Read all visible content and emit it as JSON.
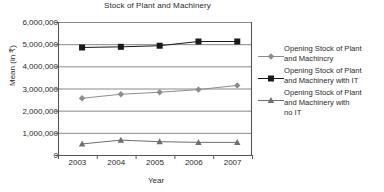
{
  "chart_data": {
    "type": "line",
    "title": "Stock of Plant and Machinery",
    "xlabel": "Year",
    "ylabel": "Mean (in ₹)",
    "categories": [
      "2003",
      "2004",
      "2005",
      "2006",
      "2007"
    ],
    "x": [
      2003,
      2004,
      2005,
      2006,
      2007
    ],
    "ylim": [
      0,
      6000000
    ],
    "ytick_labels": [
      "0",
      "1,000,000",
      "2,000,000",
      "3,000,000",
      "4,000,000",
      "5,000,000",
      "6,000,000"
    ],
    "ytick_values": [
      0,
      1000000,
      2000000,
      3000000,
      4000000,
      5000000,
      6000000
    ],
    "grid": true,
    "legend_position": "right",
    "series": [
      {
        "name": "Opening Stock of Plant and Machincry",
        "name_lines": [
          "Opening Stock of Plant",
          "and Machincry"
        ],
        "marker": "diamond",
        "color": "#8c8c8c",
        "values": [
          2560000,
          2740000,
          2830000,
          2950000,
          3140000
        ]
      },
      {
        "name": "Opening Stock of Plant and Machinery with IT",
        "name_lines": [
          "Opening Stock of Plant",
          "and Machinery with IT"
        ],
        "marker": "square",
        "color": "#1a1a1a",
        "values": [
          4850000,
          4880000,
          4930000,
          5120000,
          5120000
        ]
      },
      {
        "name": "Opening Stock of Plant and Machinery with no IT",
        "name_lines": [
          "Opening Stock of Plant",
          "and Machinery with",
          "no IT"
        ],
        "marker": "triangle",
        "color": "#6e6e6e",
        "values": [
          500000,
          670000,
          600000,
          570000,
          570000
        ]
      }
    ]
  },
  "colors": {
    "axis": "#555555",
    "grid": "#7a7a7a",
    "text": "#2a2a2a",
    "series_1": "#8c8c8c",
    "series_2": "#1a1a1a",
    "series_3": "#6e6e6e"
  }
}
